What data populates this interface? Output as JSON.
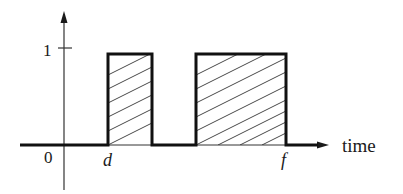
{
  "diagram": {
    "type": "pulse-train / indicator function plot",
    "axes": {
      "x_label": "time",
      "origin_label": "0",
      "y_tick_label": "1"
    },
    "markers": {
      "start_label": "d",
      "end_label": "f"
    },
    "pulses": [
      {
        "name": "first-pulse",
        "height": 1,
        "hatched": true
      },
      {
        "name": "second-pulse",
        "height": 1,
        "hatched": true
      }
    ],
    "colors": {
      "stroke": "#1a1a1a",
      "background": "#ffffff",
      "hatch": "#333333"
    }
  }
}
